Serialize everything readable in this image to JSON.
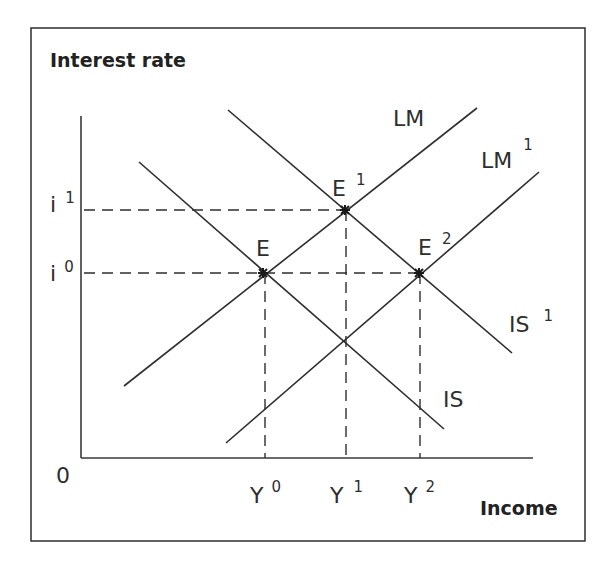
{
  "diagram": {
    "y_axis_title": "Interest rate",
    "x_axis_title": "Income",
    "origin_label": "0",
    "interest_levels": [
      {
        "base": "i",
        "sup": "1",
        "y": 210
      },
      {
        "base": "i",
        "sup": "0",
        "y": 273
      }
    ],
    "income_levels": [
      {
        "base": "Y",
        "sup": "0",
        "x": 265
      },
      {
        "base": "Y",
        "sup": "1",
        "x": 346
      },
      {
        "base": "Y",
        "sup": "2",
        "x": 420
      }
    ],
    "curves": [
      {
        "id": "LM",
        "base": "LM",
        "sup": "",
        "x1": 124,
        "y1": 386,
        "x2": 477,
        "y2": 108
      },
      {
        "id": "LM1",
        "base": "LM",
        "sup": "1",
        "x1": 226,
        "y1": 443,
        "x2": 539,
        "y2": 172
      },
      {
        "id": "IS",
        "base": "IS",
        "sup": "",
        "x1": 139,
        "y1": 162,
        "x2": 444,
        "y2": 429
      },
      {
        "id": "IS1",
        "base": "IS",
        "sup": "1",
        "x1": 228,
        "y1": 110,
        "x2": 512,
        "y2": 353
      }
    ],
    "equilibria": [
      {
        "base": "E",
        "sup": "",
        "x": 263,
        "y": 273
      },
      {
        "base": "E",
        "sup": "1",
        "x": 345,
        "y": 210
      },
      {
        "base": "E",
        "sup": "2",
        "x": 419,
        "y": 273
      }
    ],
    "colors": {
      "line": "#2e2e2e",
      "frame": "#3a3a3a",
      "background": "#ffffff"
    }
  }
}
